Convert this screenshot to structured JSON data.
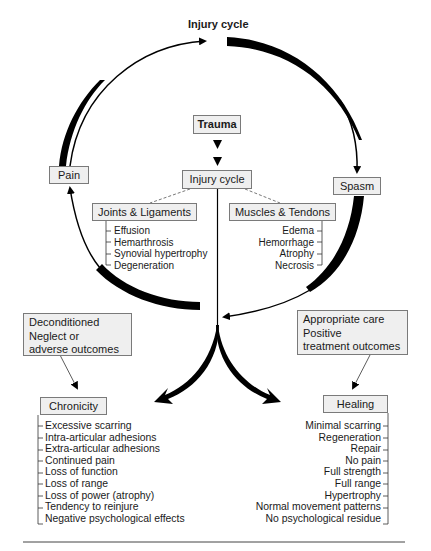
{
  "title": "Injury cycle",
  "colors": {
    "box_fill": "#efefef",
    "box_border": "#7a7a7a",
    "arrow": "#000000",
    "text": "#1a1a1a"
  },
  "cycle": {
    "trauma": "Trauma",
    "center": "Injury cycle",
    "pain": "Pain",
    "spasm": "Spasm"
  },
  "joints": {
    "label": "Joints & Ligaments",
    "items": [
      "Effusion",
      "Hemarthrosis",
      "Synovial hypertrophy",
      "Degeneration"
    ]
  },
  "muscles": {
    "label": "Muscles & Tendons",
    "items": [
      "Edema",
      "Hemorrhage",
      "Atrophy",
      "Necrosis"
    ]
  },
  "negative_path": {
    "condition_lines": [
      "Deconditioned",
      "Neglect or",
      "adverse outcomes"
    ],
    "outcome": "Chronicity",
    "items": [
      "Excessive scarring",
      "Intra-articular adhesions",
      "Extra-articular adhesions",
      "Continued pain",
      "Loss of function",
      "Loss of range",
      "Loss of power (atrophy)",
      "Tendency to reinjure",
      "Negative psychological effects"
    ]
  },
  "positive_path": {
    "condition_lines": [
      "Appropriate care",
      "Positive",
      "treatment outcomes"
    ],
    "outcome": "Healing",
    "items": [
      "Minimal scarring",
      "Regeneration",
      "Repair",
      "No pain",
      "Full strength",
      "Full range",
      "Hypertrophy",
      "Normal movement patterns",
      "No psychological residue"
    ]
  }
}
